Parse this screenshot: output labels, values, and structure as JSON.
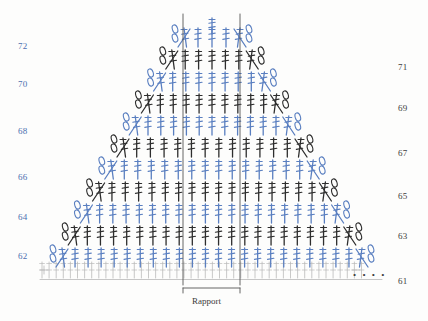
{
  "meta": {
    "type": "crochet-stitch-chart",
    "width": 428,
    "height": 321
  },
  "colors": {
    "blue": "#5a7fc0",
    "blue_dark": "#3f63a8",
    "dark": "#2e2e2e",
    "grey": "#b9b9b9",
    "background": "#fdfdfc"
  },
  "left_labels": [
    {
      "text": "72",
      "x": 18,
      "y": 41
    },
    {
      "text": "70",
      "x": 18,
      "y": 79
    },
    {
      "text": "68",
      "x": 18,
      "y": 126
    },
    {
      "text": "66",
      "x": 18,
      "y": 172
    },
    {
      "text": "64",
      "x": 18,
      "y": 212
    },
    {
      "text": "62",
      "x": 18,
      "y": 251
    }
  ],
  "right_labels": [
    {
      "text": "71",
      "x": 398,
      "y": 62
    },
    {
      "text": "69",
      "x": 398,
      "y": 103
    },
    {
      "text": "67",
      "x": 398,
      "y": 148
    },
    {
      "text": "65",
      "x": 398,
      "y": 191
    },
    {
      "text": "63",
      "x": 398,
      "y": 231
    },
    {
      "text": "61",
      "x": 398,
      "y": 276
    }
  ],
  "rapport": {
    "label": "Rapport",
    "x": 192,
    "y": 296,
    "bracket_left": 183,
    "bracket_right": 240,
    "guide_top": 14,
    "guide_bottom": 285
  },
  "dots": {
    "text": "• • • •",
    "x": 353,
    "y": 270
  },
  "chart": {
    "rows": 12,
    "row_spacing": 22,
    "note": "alternating blue and dark stitch rows, triangular increase shape"
  }
}
